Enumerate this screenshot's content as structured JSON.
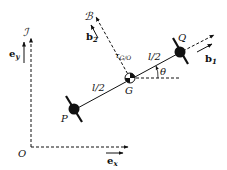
{
  "diagram": {
    "type": "rigid-body kinematics diagram",
    "frames": {
      "inertial": {
        "label": "ℐ",
        "unit_x": "e",
        "unit_x_sub": "x",
        "unit_y": "e",
        "unit_y_sub": "y"
      },
      "body": {
        "label": "ℬ",
        "unit_1": "b",
        "unit_1_sub": "1",
        "unit_2": "b",
        "unit_2_sub": "2"
      }
    },
    "points": {
      "origin": "O",
      "p": "P",
      "g": "G",
      "q": "Q"
    },
    "segments": {
      "pg_length": "l/2",
      "gq_length": "l/2"
    },
    "angle": "θ",
    "moment_label": {
      "main": "τ",
      "sub": "G/O"
    },
    "colors": {
      "ink": "#111111",
      "background": "#ffffff"
    }
  }
}
